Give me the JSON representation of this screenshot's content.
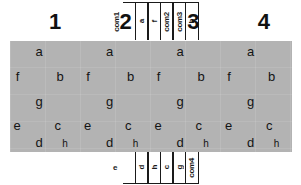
{
  "component": {
    "type": "4-digit 7-segment LED display pinout",
    "body_color": "#b3b3b3",
    "ink_color": "#141414"
  },
  "digit_numbers": [
    {
      "label": "1",
      "x_pct": 16
    },
    {
      "label": "2",
      "x_pct": 41
    },
    {
      "label": "3",
      "x_pct": 65
    },
    {
      "label": "4",
      "x_pct": 90
    }
  ],
  "pins_top": [
    {
      "label": "com1"
    },
    {
      "label": "a"
    },
    {
      "label": "f"
    },
    {
      "label": "com2"
    },
    {
      "label": "com3"
    },
    {
      "label": "b"
    }
  ],
  "pins_bottom": [
    {
      "label": "e"
    },
    {
      "label": "d"
    },
    {
      "label": "h"
    },
    {
      "label": "c"
    },
    {
      "label": "g"
    },
    {
      "label": "com4"
    }
  ],
  "segment_labels": {
    "a": "a",
    "b": "b",
    "c": "c",
    "d": "d",
    "e": "e",
    "f": "f",
    "g": "g",
    "h": "h"
  },
  "digits": [
    {
      "index": "1",
      "segments": {
        "a": "a",
        "f": "f",
        "b": "b",
        "g": "g",
        "e": "e",
        "c": "c",
        "d": "d",
        "h": "h"
      }
    },
    {
      "index": "2",
      "segments": {
        "a": "a",
        "f": "f",
        "b": "b",
        "g": "g",
        "e": "e",
        "c": "c",
        "d": "d",
        "h": "h"
      }
    },
    {
      "index": "3",
      "segments": {
        "a": "a",
        "f": "f",
        "b": "b",
        "g": "g",
        "e": "e",
        "c": "c",
        "d": "d",
        "h": "h"
      }
    },
    {
      "index": "4",
      "segments": {
        "a": "a",
        "f": "f",
        "b": "b",
        "g": "g",
        "e": "e",
        "c": "c",
        "d": "d",
        "h": "h"
      }
    }
  ]
}
